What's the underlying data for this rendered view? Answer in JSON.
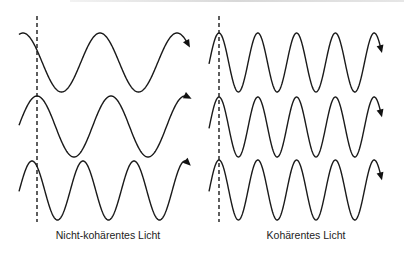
{
  "diagram": {
    "panels": [
      {
        "id": "non-coherent",
        "label": "Nicht-kohärentes Licht",
        "label_x": 108,
        "dashed_line": {
          "x": 37,
          "y1": 16,
          "y2": 222
        },
        "waves": [
          {
            "x_start": 19,
            "x_end": 188,
            "center_y": 62.5,
            "amplitude": 29.5,
            "period": 77,
            "peak_x": 23
          },
          {
            "x_start": 19,
            "x_end": 188,
            "center_y": 126.5,
            "amplitude": 30.5,
            "period": 74,
            "peak_x": 37
          },
          {
            "x_start": 19,
            "x_end": 188,
            "center_y": 190.5,
            "amplitude": 29.5,
            "period": 51,
            "peak_x": 32
          }
        ]
      },
      {
        "id": "coherent",
        "label": "Kohärentes Licht",
        "label_x": 306,
        "dashed_line": {
          "x": 219,
          "y1": 16,
          "y2": 222
        },
        "waves": [
          {
            "x_start": 209,
            "x_end": 381,
            "center_y": 62.5,
            "amplitude": 29.5,
            "period": 38.8,
            "peak_x": 219
          },
          {
            "x_start": 209,
            "x_end": 381,
            "center_y": 127,
            "amplitude": 30,
            "period": 38.8,
            "peak_x": 219
          },
          {
            "x_start": 209,
            "x_end": 381,
            "center_y": 190,
            "amplitude": 30,
            "period": 38.8,
            "peak_x": 219
          }
        ]
      }
    ],
    "colors": {
      "stroke": "#1a1a1a",
      "text": "#222222",
      "background": "#ffffff"
    }
  }
}
